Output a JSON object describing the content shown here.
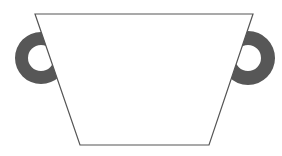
{
  "figure": {
    "colors": {
      "background": "#ffffff",
      "outline": "#555555",
      "handle": "#575757",
      "body_fill": "#ffffff"
    }
  }
}
